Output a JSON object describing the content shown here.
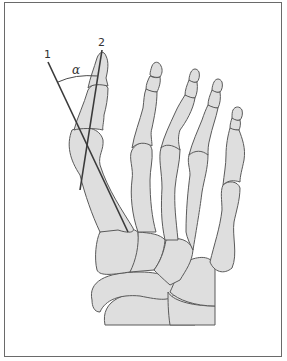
{
  "figure": {
    "labels": {
      "line1": "1",
      "line2": "2",
      "angle": "α"
    },
    "colors": {
      "bone_fill": "#dedede",
      "bone_outline": "#5a5a5a",
      "axis_line": "#3a3a3a",
      "frame": "#6a6a6a"
    }
  }
}
